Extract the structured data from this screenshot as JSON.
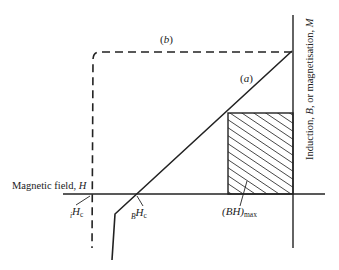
{
  "diagram": {
    "type": "hysteresis-demagnetisation-quadrant",
    "axes": {
      "horizontal_label": "Magnetic field, H",
      "horizontal_label_text": "Magnetic field, ",
      "horizontal_label_symbol": "H",
      "vertical_label_text": "Induction, B, or magnetisation, M",
      "vertical_label_parts": [
        "Induction, ",
        "B",
        ", or magnetisation, ",
        "M"
      ]
    },
    "curves": [
      {
        "id": "a",
        "label": "(a)",
        "label_text": "a",
        "style": "solid",
        "description": "B-H curve"
      },
      {
        "id": "b",
        "label": "(b)",
        "label_text": "b",
        "style": "dashed",
        "description": "M-H curve"
      }
    ],
    "annotations": {
      "intrinsic_coercivity": {
        "prefix": "i",
        "symbol": "H",
        "subscript": "c"
      },
      "normal_coercivity": {
        "prefix": "B",
        "symbol": "H",
        "subscript": "c"
      },
      "max_energy_product": {
        "symbol": "(BH)",
        "subscript": "max"
      }
    },
    "colors": {
      "line": "#222222",
      "background": "#ffffff"
    }
  }
}
